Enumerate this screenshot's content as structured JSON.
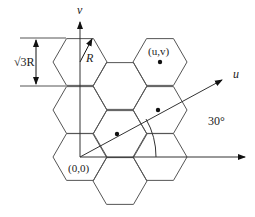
{
  "diagram": {
    "type": "hexagonal-lattice-coordinate-system",
    "labels": {
      "v_axis": "v",
      "u_axis": "u",
      "radius": "R",
      "height_dim": "√3R",
      "point_uv": "(u,v)",
      "origin": "(0,0)",
      "angle": "30°"
    },
    "colors": {
      "line": "#555555",
      "arrow": "#111111",
      "dot": "#111111"
    },
    "hexagon_radius_px": 27,
    "hex_centers": [
      [
        80,
        62
      ],
      [
        80,
        110
      ],
      [
        80,
        157
      ],
      [
        120,
        86
      ],
      [
        120,
        134
      ],
      [
        120,
        181
      ],
      [
        160,
        62
      ],
      [
        160,
        110
      ],
      [
        160,
        157
      ]
    ],
    "dots": [
      [
        117,
        134
      ],
      [
        158,
        110
      ],
      [
        160,
        62
      ]
    ]
  }
}
